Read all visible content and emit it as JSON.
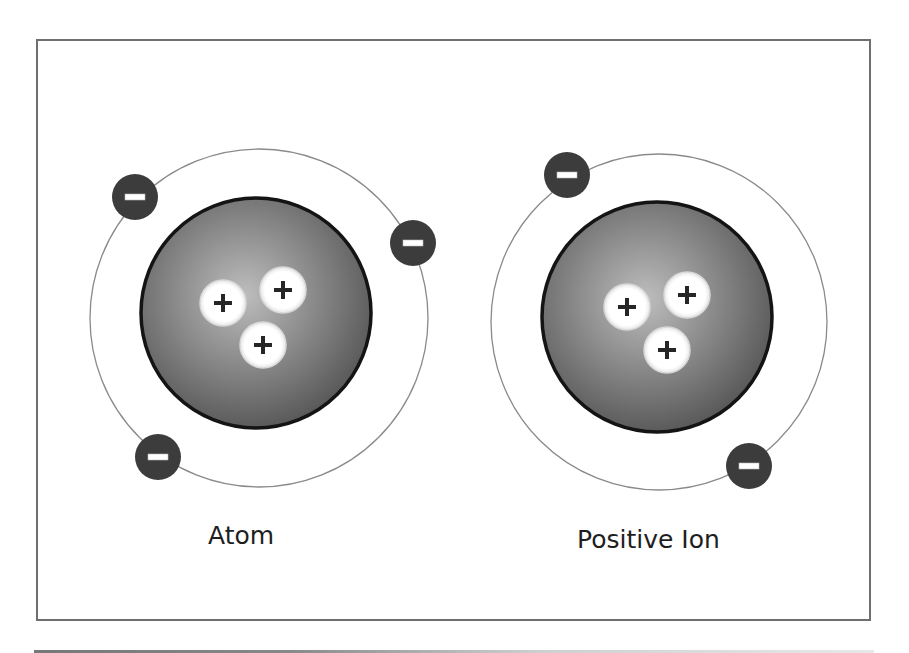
{
  "margin_fragments": [
    "s",
    "t",
    "."
  ],
  "diagrams": [
    {
      "id": "atom",
      "label": "Atom",
      "orbit": {
        "cx": 259,
        "cy": 318,
        "r": 169
      },
      "nucleus": {
        "cx": 256,
        "cy": 313,
        "r": 115
      },
      "protons": [
        {
          "cx": 223,
          "cy": 303,
          "symbol": "+"
        },
        {
          "cx": 283,
          "cy": 290,
          "symbol": "+"
        },
        {
          "cx": 263,
          "cy": 345,
          "symbol": "+"
        }
      ],
      "electrons": [
        {
          "cx": 135,
          "cy": 197,
          "symbol": "−"
        },
        {
          "cx": 413,
          "cy": 243,
          "symbol": "−"
        },
        {
          "cx": 158,
          "cy": 457,
          "symbol": "−"
        }
      ],
      "proton_count": 3,
      "electron_count": 3
    },
    {
      "id": "positive-ion",
      "label": "Positive Ion",
      "orbit": {
        "cx": 659,
        "cy": 322,
        "r": 168
      },
      "nucleus": {
        "cx": 657,
        "cy": 317,
        "r": 115
      },
      "protons": [
        {
          "cx": 627,
          "cy": 307,
          "symbol": "+"
        },
        {
          "cx": 687,
          "cy": 295,
          "symbol": "+"
        },
        {
          "cx": 667,
          "cy": 350,
          "symbol": "+"
        }
      ],
      "electrons": [
        {
          "cx": 567,
          "cy": 175,
          "symbol": "−"
        },
        {
          "cx": 749,
          "cy": 466,
          "symbol": "−"
        }
      ],
      "proton_count": 3,
      "electron_count": 2
    }
  ],
  "labels": {
    "atom": "Atom",
    "positive_ion": "Positive Ion"
  },
  "colors": {
    "frame": "#6f6f6f",
    "orbit": "#8a8a8a",
    "nucleus_light": "#b4b4b4",
    "nucleus_dark": "#5a5a5a",
    "nucleus_edge": "#141414",
    "electron": "#3c3c3c",
    "proton": "#ffffff",
    "sign_dark": "#262626"
  }
}
